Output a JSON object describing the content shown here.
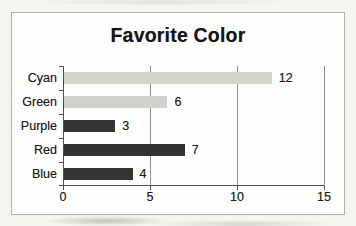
{
  "page": {
    "paper_color": "#f5f4f0",
    "chart_background": "#fdfdfc",
    "frame_border_color": "#b3b2ae"
  },
  "chart": {
    "axis_color": "#4e4e4c",
    "gridline_color": "#8f8f8d",
    "text_color": "#1c1c1b",
    "title_color": "#161616"
  },
  "chart_data": {
    "type": "bar",
    "orientation": "horizontal",
    "title": "Favorite Color",
    "categories": [
      "Cyan",
      "Green",
      "Purple",
      "Red",
      "Blue"
    ],
    "values": [
      12,
      6,
      3,
      7,
      4
    ],
    "bar_colors": [
      "#d5d4d1",
      "#d2d1ce",
      "#343331",
      "#333230",
      "#363533"
    ],
    "xlim": [
      0,
      15
    ],
    "xticks": [
      0,
      5,
      10,
      15
    ],
    "xlabel": "",
    "ylabel": "",
    "grid": true,
    "legend": false,
    "data_labels": true
  }
}
